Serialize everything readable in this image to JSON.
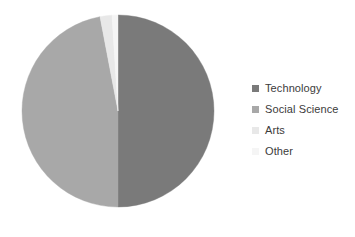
{
  "chart_data": {
    "type": "pie",
    "title": "",
    "categories": [
      "Technology",
      "Social Science",
      "Arts",
      "Other"
    ],
    "values": [
      50,
      47,
      2,
      1
    ],
    "colors": [
      "#7a7a7a",
      "#a8a8a8",
      "#e8e8e8",
      "#f5f5f5"
    ],
    "legend_position": "right",
    "grid": false,
    "start_angle_deg": 0,
    "direction": "clockwise",
    "center": {
      "x": 118,
      "y": 111
    },
    "radius": 96
  },
  "legend": {
    "items": [
      {
        "label": "Technology",
        "color": "#7a7a7a",
        "swatch_name": "legend-swatch-technology"
      },
      {
        "label": "Social Science",
        "color": "#a8a8a8",
        "swatch_name": "legend-swatch-social-science"
      },
      {
        "label": "Arts",
        "color": "#e8e8e8",
        "swatch_name": "legend-swatch-arts"
      },
      {
        "label": "Other",
        "color": "#f5f5f5",
        "swatch_name": "legend-swatch-other"
      }
    ]
  },
  "style": {
    "background": "#ffffff",
    "text_color": "#3b3b3b"
  }
}
